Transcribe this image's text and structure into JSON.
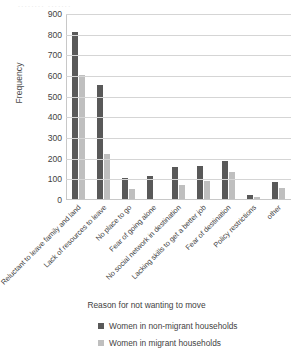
{
  "chart_data": {
    "type": "bar",
    "title": "",
    "xlabel": "Reason for not wanting to move",
    "ylabel": "Frequency",
    "ylim": [
      0,
      900
    ],
    "ytick_step": 100,
    "yticks": [
      900,
      800,
      700,
      600,
      500,
      400,
      300,
      200,
      100,
      0
    ],
    "grid": true,
    "legend_position": "bottom-left",
    "categories": [
      "Reluctant to leave family and land",
      "Lack of resources to leave",
      "No place to go",
      "Fear of going alone",
      "No social network in destination",
      "Lacking skills to get a better job",
      "Fear of destination",
      "Policy restrictions",
      "other"
    ],
    "series": [
      {
        "name": "Women in non-migrant households",
        "color": "#595959",
        "values": [
          810,
          550,
          100,
          110,
          155,
          160,
          185,
          20,
          80
        ]
      },
      {
        "name": "Women in migrant households",
        "color": "#bfbfbf",
        "values": [
          600,
          220,
          50,
          0,
          70,
          85,
          130,
          10,
          55
        ]
      }
    ]
  },
  "bleed": {
    "top_artifact": "........ ......."
  }
}
